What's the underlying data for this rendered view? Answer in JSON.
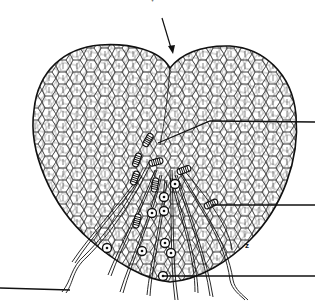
{
  "figure": {
    "type": "botanical-line-drawing",
    "top_caption_partial": "— — — ▾ — — — —",
    "small_mark": "z",
    "colors": {
      "ink": "#111111",
      "background": "#ffffff"
    }
  },
  "pointer_arrow": {
    "from": [
      162,
      18
    ],
    "to": [
      172,
      52
    ]
  },
  "leaders": [
    {
      "id": "leader-top-right",
      "points": [
        [
          158,
          143
        ],
        [
          210,
          121
        ],
        [
          315,
          122
        ]
      ],
      "label": ""
    },
    {
      "id": "leader-mid-right",
      "points": [
        [
          212,
          205
        ],
        [
          315,
          205
        ]
      ],
      "label": ""
    },
    {
      "id": "leader-bottom-right",
      "points": [
        [
          163,
          276
        ],
        [
          315,
          276
        ]
      ],
      "label": ""
    },
    {
      "id": "leader-bottom-left",
      "points": [
        [
          0,
          288
        ],
        [
          70,
          290
        ]
      ],
      "label": ""
    }
  ],
  "antheridia": [
    {
      "x": 148,
      "y": 140,
      "rot": -60
    },
    {
      "x": 137,
      "y": 160,
      "rot": -70
    },
    {
      "x": 135,
      "y": 178,
      "rot": -70
    },
    {
      "x": 156,
      "y": 162,
      "rot": -15
    },
    {
      "x": 184,
      "y": 170,
      "rot": -20
    },
    {
      "x": 155,
      "y": 185,
      "rot": -80
    },
    {
      "x": 211,
      "y": 204,
      "rot": -25
    },
    {
      "x": 137,
      "y": 221,
      "rot": -75
    }
  ],
  "archegonia": [
    {
      "x": 175,
      "y": 184
    },
    {
      "x": 164,
      "y": 197
    },
    {
      "x": 164,
      "y": 211
    },
    {
      "x": 152,
      "y": 213
    },
    {
      "x": 107,
      "y": 248
    },
    {
      "x": 142,
      "y": 251
    },
    {
      "x": 165,
      "y": 243
    },
    {
      "x": 171,
      "y": 253
    },
    {
      "x": 163,
      "y": 276
    }
  ]
}
